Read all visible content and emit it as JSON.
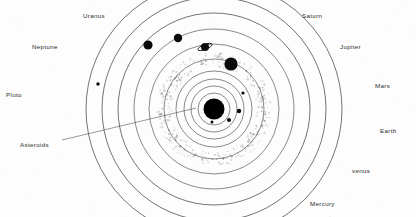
{
  "figure": {
    "kind": "solar-system-orbit-diagram",
    "width": 416,
    "height": 217,
    "background_color": "#fdfdfd",
    "line_color": "#1d1d1d",
    "body_color": "#0a0a0a",
    "belt_color": "#b9b9b9"
  },
  "labels": [
    {
      "id": "uranus",
      "text": "Uranus",
      "x": 83,
      "y": 13
    },
    {
      "id": "saturn",
      "text": "Saturn",
      "x": 302,
      "y": 13
    },
    {
      "id": "neptune",
      "text": "Neptune",
      "x": 32,
      "y": 44
    },
    {
      "id": "jupiter",
      "text": "Jupiter",
      "x": 340,
      "y": 44
    },
    {
      "id": "mars",
      "text": "Mars",
      "x": 375,
      "y": 83
    },
    {
      "id": "pluto",
      "text": "Pluto",
      "x": 6,
      "y": 92
    },
    {
      "id": "earth",
      "text": "Earth",
      "x": 380,
      "y": 128
    },
    {
      "id": "asteroids",
      "text": "Asteroids",
      "x": 20,
      "y": 142
    },
    {
      "id": "venus",
      "text": "venus",
      "x": 352,
      "y": 168
    },
    {
      "id": "mercury",
      "text": "Mercury",
      "x": 310,
      "y": 201
    }
  ],
  "center": {
    "x": 214,
    "y": 109
  },
  "orbits": [
    {
      "id": "orbit-pluto",
      "r": 128
    },
    {
      "id": "orbit-neptune",
      "r": 112
    },
    {
      "id": "orbit-uranus",
      "r": 96
    },
    {
      "id": "orbit-saturn",
      "r": 80
    },
    {
      "id": "orbit-jupiter",
      "r": 65
    },
    {
      "id": "orbit-belt",
      "r": 50
    },
    {
      "id": "orbit-mars",
      "r": 38
    },
    {
      "id": "orbit-earth",
      "r": 30
    },
    {
      "id": "orbit-venus",
      "r": 23
    },
    {
      "id": "orbit-mercury",
      "r": 16
    }
  ],
  "bodies": [
    {
      "id": "sun",
      "name": "Sun",
      "cx": 214,
      "cy": 109,
      "r": 10.5,
      "kind": "star"
    },
    {
      "id": "pluto",
      "name": "Pluto",
      "cx": 98,
      "cy": 84,
      "r": 1.7,
      "kind": "dwarf"
    },
    {
      "id": "neptune",
      "name": "Neptune",
      "cx": 148,
      "cy": 45,
      "r": 4.6,
      "kind": "giant"
    },
    {
      "id": "uranus",
      "name": "Uranus",
      "cx": 178,
      "cy": 38,
      "r": 4.2,
      "kind": "giant"
    },
    {
      "id": "saturn",
      "name": "Saturn",
      "cx": 205,
      "cy": 47,
      "r": 4.0,
      "kind": "ringed"
    },
    {
      "id": "jupiter",
      "name": "Jupiter",
      "cx": 231,
      "cy": 64,
      "r": 6.6,
      "kind": "giant"
    },
    {
      "id": "mars",
      "name": "Mars",
      "cx": 243,
      "cy": 93,
      "r": 1.6,
      "kind": "rocky"
    },
    {
      "id": "earth",
      "name": "Earth",
      "cx": 239,
      "cy": 111,
      "r": 2.2,
      "kind": "rocky"
    },
    {
      "id": "venus",
      "name": "venus",
      "cx": 229,
      "cy": 120,
      "r": 2.0,
      "kind": "rocky"
    },
    {
      "id": "mercury",
      "name": "Mercury",
      "cx": 212,
      "cy": 122,
      "r": 1.5,
      "kind": "rocky"
    }
  ],
  "saturn_ring": {
    "cx": 205,
    "cy": 47,
    "rx": 7.6,
    "ry": 2.5,
    "rotate": -22
  },
  "asteroid_belt": {
    "inner_r": 42,
    "outer_r": 57,
    "speck_count": 420,
    "label_ref": "Asteroids"
  },
  "leader_line": {
    "from_x": 62,
    "from_y": 140,
    "to_x": 196,
    "to_y": 108
  }
}
